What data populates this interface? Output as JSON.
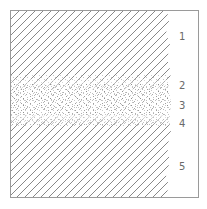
{
  "diagram": {
    "type": "layered-cross-section",
    "colors": {
      "border": "#9a9a9a",
      "hatch": "#7a7a7a",
      "stipple": "#9c9c9c",
      "label": "#6a6a6a",
      "background": "#ffffff"
    },
    "layers": [
      {
        "id": 1,
        "label": "1",
        "pattern": "diagonal-hatch",
        "y_range": [
          11,
          78
        ]
      },
      {
        "id": 2,
        "label": "2",
        "pattern": "hatch-to-stipple-transition",
        "y_range": [
          78,
          90
        ]
      },
      {
        "id": 3,
        "label": "3",
        "pattern": "stipple",
        "y_range": [
          90,
          112
        ]
      },
      {
        "id": 4,
        "label": "4",
        "pattern": "stipple-to-hatch-transition",
        "y_range": [
          112,
          124
        ]
      },
      {
        "id": 5,
        "label": "5",
        "pattern": "diagonal-hatch",
        "y_range": [
          124,
          197
        ]
      }
    ]
  }
}
